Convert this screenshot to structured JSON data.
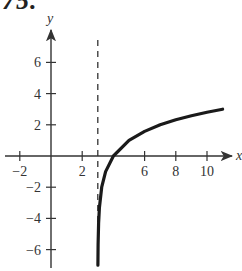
{
  "problem_number": "75.",
  "colors": {
    "axis": "#333333",
    "curve": "#1a1a1a",
    "asymptote": "#333333",
    "text": "#333333"
  },
  "chart_data": {
    "type": "line",
    "title": "",
    "xlabel": "x",
    "ylabel": "y",
    "xlim": [
      -3.2,
      11.8
    ],
    "ylim": [
      -7.2,
      7.5
    ],
    "grid": false,
    "legend": null,
    "x_ticks": [
      -2,
      2,
      6,
      8,
      10
    ],
    "x_tick_labels": [
      "−2",
      "2",
      "6",
      "8",
      "10"
    ],
    "y_ticks": [
      6,
      4,
      2,
      -2,
      -4,
      -6
    ],
    "y_tick_labels": [
      "6",
      "4",
      "2",
      "−2",
      "−4",
      "−6"
    ],
    "vertical_asymptote": {
      "x": 3,
      "style": "dashed"
    },
    "series": [
      {
        "name": "curve",
        "description": "logarithmic curve y = log2(x - 3)",
        "x": [
          3.008,
          3.02,
          3.05,
          3.1,
          3.25,
          3.5,
          4,
          5,
          6,
          7,
          8,
          9,
          10,
          11
        ],
        "y": [
          -7.0,
          -5.64,
          -4.32,
          -3.32,
          -2.0,
          -1.0,
          0,
          1.0,
          1.58,
          2.0,
          2.32,
          2.58,
          2.81,
          3.0
        ]
      }
    ],
    "annotations": [
      "x-intercept at (4, 0)"
    ]
  }
}
